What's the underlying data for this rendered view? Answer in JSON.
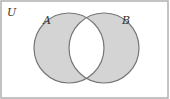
{
  "diagram": {
    "type": "venn",
    "universe_label": "U",
    "sets": [
      {
        "label": "A",
        "cx": 69,
        "cy": 48,
        "r": 35
      },
      {
        "label": "B",
        "cx": 104,
        "cy": 48,
        "r": 35
      }
    ],
    "shaded_region": "symmetric-difference",
    "colors": {
      "fill": "#d4d4d4",
      "stroke": "#777777",
      "background": "#ffffff",
      "frame": "#999999"
    }
  }
}
